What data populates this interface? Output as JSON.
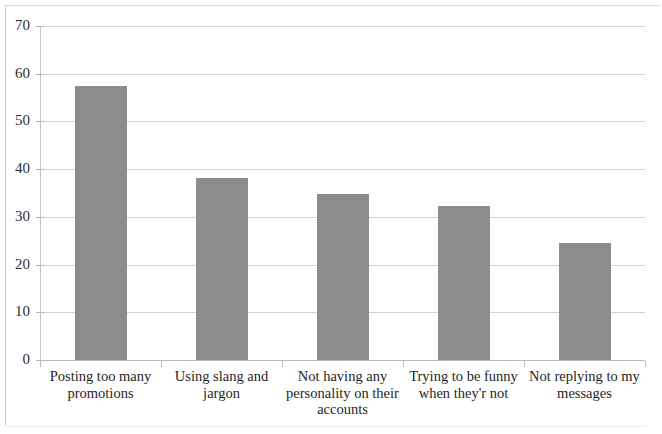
{
  "chart_data": {
    "type": "bar",
    "title": "",
    "xlabel": "",
    "ylabel": "",
    "ylim": [
      0,
      70
    ],
    "y_ticks": [
      0,
      10,
      20,
      30,
      40,
      50,
      60,
      70
    ],
    "grid": true,
    "legend": "none",
    "orientation": "vertical",
    "bar_color": "#8c8c8c",
    "categories": [
      "Posting too many promotions",
      "Using slang and jargon",
      "Not having any personality on their accounts",
      "Trying to be funny when they'r not",
      "Not replying to my messages"
    ],
    "category_lines": [
      [
        "Posting too many",
        "promotions"
      ],
      [
        "Using slang and",
        "jargon"
      ],
      [
        "Not having any",
        "personality on their",
        "accounts"
      ],
      [
        "Trying to be funny",
        "when they'r not"
      ],
      [
        "Not replying to my",
        "messages"
      ]
    ],
    "values": [
      57.5,
      38.2,
      34.7,
      32.2,
      24.6
    ],
    "series": [
      {
        "name": "",
        "values": [
          57.5,
          38.2,
          34.7,
          32.2,
          24.6
        ]
      }
    ]
  }
}
